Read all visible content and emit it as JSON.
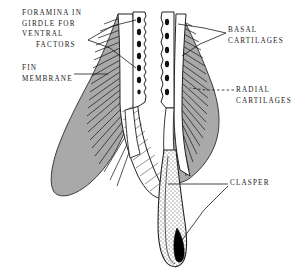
{
  "figure": {
    "background_color": "#ffffff",
    "ink_color": "#1a1a1a",
    "membrane_fill": "#a8a8a8",
    "clasper_tip_fill": "#000000"
  },
  "labels": {
    "foramina": {
      "line1": "FORAMINA IN",
      "line2": "GIRDLE FOR",
      "line3": "VENTRAL",
      "line4": "FACTORS"
    },
    "fin_membrane": {
      "line1": "FIN",
      "line2": "MEMBRANE"
    },
    "basal": {
      "line1": "BASAL",
      "line2": "CARTILAGES"
    },
    "radial": {
      "line1": "RADIAL",
      "line2": "CARTILAGES"
    },
    "clasper": {
      "line1": "CLASPER"
    }
  },
  "structures": {
    "left_girdle_foramina_count": 7,
    "right_girdle_foramina_count": 6,
    "left_radial_count": 22,
    "right_radial_count": 20
  }
}
